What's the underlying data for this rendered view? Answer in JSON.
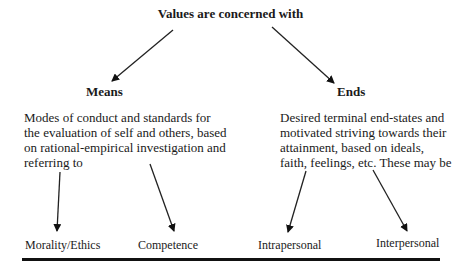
{
  "diagram": {
    "title": "Values are concerned with",
    "branches": [
      {
        "label": "Means",
        "description": "Modes of conduct and standards for the evaluation of self and others, based on rational-empirical investigation and referring to",
        "description_lines": [
          "Modes of conduct and standards for",
          "the evaluation of self and others, based",
          "on rational-empirical investigation and",
          "referring to"
        ],
        "children": [
          "Morality/Ethics",
          "Competence"
        ]
      },
      {
        "label": "Ends",
        "description": "Desired terminal end-states and motivated striving towards their attainment, based on ideals, faith, feelings, etc. These may be",
        "description_lines": [
          "Desired terminal end-states and",
          "motivated striving towards their",
          "attainment, based on ideals,",
          "faith, feelings, etc. These may be"
        ],
        "children": [
          "Intrapersonal",
          "Interpersonal"
        ]
      }
    ],
    "colors": {
      "ink": "#1a1a1a",
      "background": "#ffffff"
    }
  }
}
